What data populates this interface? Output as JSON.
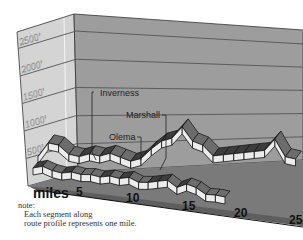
{
  "chart_data": {
    "type": "area",
    "title": "",
    "xlabel": "miles",
    "ylabel": "",
    "x_ticks": [
      5,
      10,
      15,
      20,
      25
    ],
    "y_ticks": [
      "500'",
      "1000'",
      "1500'",
      "2000'",
      "2500'"
    ],
    "ylim": [
      0,
      2800
    ],
    "xlim": [
      0,
      26
    ],
    "grid": true,
    "series": [
      {
        "name": "front-route",
        "x": [
          1,
          2,
          3,
          4,
          5,
          6,
          7,
          8,
          9,
          10,
          11,
          12,
          13,
          14,
          15,
          16,
          17,
          18,
          19,
          20,
          21
        ],
        "values": [
          200,
          250,
          200,
          180,
          220,
          200,
          220,
          200,
          240,
          220,
          260,
          200,
          220,
          260,
          300,
          200,
          280,
          240,
          150,
          160,
          150
        ]
      },
      {
        "name": "back-route",
        "x": [
          1,
          2,
          3,
          4,
          5,
          6,
          7,
          8,
          9,
          10,
          11,
          12,
          13,
          14,
          15,
          16,
          17,
          18,
          19,
          20,
          21,
          22,
          23,
          24,
          25,
          26
        ],
        "values": [
          250,
          420,
          400,
          300,
          280,
          320,
          300,
          340,
          300,
          260,
          300,
          420,
          520,
          560,
          700,
          540,
          500,
          380,
          400,
          420,
          440,
          460,
          480,
          620,
          420,
          400
        ]
      }
    ],
    "annotations": [
      {
        "label": "Inverness",
        "mile": 5
      },
      {
        "label": "Marshall",
        "mile": 14
      },
      {
        "label": "Olema",
        "mile": 12
      }
    ]
  },
  "note": {
    "heading": "note:",
    "line1": "Each segment along",
    "line2": "route profile represents one mile."
  }
}
